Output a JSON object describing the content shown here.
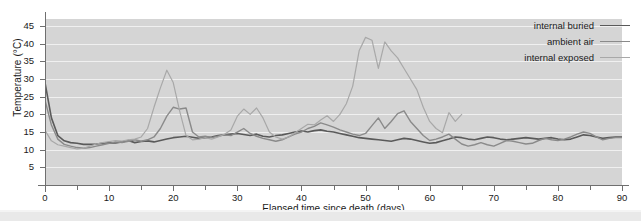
{
  "chart_data": {
    "type": "line",
    "title": "",
    "xlabel": "Elapsed time since death (days)",
    "ylabel": "Temperature (°C)",
    "xlim": [
      0,
      90
    ],
    "ylim": [
      0,
      47
    ],
    "xticks": [
      0,
      10,
      20,
      30,
      40,
      50,
      60,
      70,
      80,
      90
    ],
    "yticks": [
      5,
      10,
      15,
      20,
      25,
      30,
      35,
      40,
      45
    ],
    "xtick_minor_step": 5,
    "grid": "horizontal",
    "legend_position": "top-right",
    "plot_background": "#d5d5d5",
    "gridline_color": "#f0f0f0",
    "series": [
      {
        "name": "internal buried",
        "color": "#5a5a5a",
        "width": 1.6,
        "x": [
          0,
          1,
          2,
          3,
          4,
          5,
          6,
          7,
          8,
          9,
          10,
          11,
          12,
          13,
          14,
          15,
          16,
          17,
          18,
          19,
          20,
          21,
          22,
          23,
          24,
          25,
          26,
          27,
          28,
          29,
          30,
          31,
          32,
          33,
          34,
          35,
          36,
          37,
          38,
          39,
          40,
          41,
          42,
          43,
          44,
          45,
          46,
          47,
          48,
          49,
          50,
          51,
          52,
          53,
          54,
          55,
          56,
          57,
          58,
          59,
          60,
          61,
          62,
          63,
          64,
          65,
          66,
          67,
          68,
          69,
          70,
          71,
          72,
          73,
          74,
          75,
          76,
          77,
          78,
          79,
          80,
          81,
          82,
          83,
          84,
          85,
          86,
          87,
          88,
          89,
          90
        ],
        "y": [
          29.0,
          19.0,
          14.0,
          12.5,
          12.0,
          11.8,
          11.5,
          11.5,
          11.6,
          11.8,
          12.0,
          11.9,
          12.2,
          12.6,
          12.0,
          12.3,
          12.5,
          12.2,
          12.6,
          13.0,
          13.4,
          13.6,
          13.8,
          13.5,
          13.2,
          13.4,
          13.6,
          14.0,
          14.2,
          14.4,
          14.6,
          14.3,
          14.0,
          14.4,
          13.8,
          13.6,
          14.0,
          14.2,
          14.6,
          15.0,
          15.3,
          15.0,
          15.4,
          15.6,
          15.2,
          15.0,
          14.6,
          14.2,
          13.8,
          13.4,
          13.2,
          13.0,
          12.8,
          12.6,
          12.4,
          12.8,
          13.2,
          13.0,
          12.6,
          12.2,
          11.8,
          12.0,
          12.5,
          13.0,
          13.6,
          13.4,
          13.0,
          12.8,
          13.2,
          13.6,
          13.4,
          13.0,
          12.8,
          13.0,
          13.2,
          13.4,
          13.2,
          13.0,
          13.2,
          13.4,
          13.0,
          12.8,
          13.0,
          13.6,
          14.2,
          14.0,
          13.6,
          13.2,
          13.4,
          13.6,
          13.6
        ]
      },
      {
        "name": "ambient air",
        "color": "#8a8a8a",
        "width": 1.4,
        "x": [
          0,
          1,
          2,
          3,
          4,
          5,
          6,
          7,
          8,
          9,
          10,
          11,
          12,
          13,
          14,
          15,
          16,
          17,
          18,
          19,
          20,
          21,
          22,
          23,
          24,
          25,
          26,
          27,
          28,
          29,
          30,
          31,
          32,
          33,
          34,
          35,
          36,
          37,
          38,
          39,
          40,
          41,
          42,
          43,
          44,
          45,
          46,
          47,
          48,
          49,
          50,
          51,
          52,
          53,
          54,
          55,
          56,
          57,
          58,
          59,
          60,
          61,
          62,
          63,
          64,
          65,
          66,
          67,
          68,
          69,
          70,
          71,
          72,
          73,
          74,
          75,
          76,
          77,
          78,
          79,
          80,
          81,
          82,
          83,
          84,
          85,
          86,
          87,
          88,
          89,
          90
        ],
        "y": [
          24.0,
          17.0,
          13.0,
          11.5,
          11.0,
          10.6,
          10.4,
          10.6,
          11.0,
          11.4,
          11.8,
          12.2,
          12.0,
          12.4,
          12.8,
          12.4,
          12.8,
          13.6,
          16.0,
          19.5,
          22.0,
          21.5,
          21.8,
          15.0,
          13.6,
          13.8,
          13.4,
          13.8,
          14.2,
          14.0,
          15.0,
          16.0,
          14.6,
          13.8,
          13.2,
          12.8,
          12.4,
          12.8,
          13.6,
          14.4,
          15.0,
          16.0,
          16.6,
          17.6,
          17.0,
          16.4,
          15.6,
          15.0,
          14.4,
          14.0,
          14.6,
          16.8,
          19.0,
          16.0,
          18.0,
          20.2,
          21.0,
          18.0,
          16.0,
          14.0,
          12.6,
          13.0,
          13.6,
          14.4,
          13.0,
          11.6,
          11.0,
          11.4,
          12.0,
          11.4,
          11.0,
          11.8,
          12.6,
          12.4,
          12.0,
          11.6,
          11.8,
          12.6,
          13.2,
          12.8,
          12.6,
          13.0,
          13.6,
          14.4,
          15.0,
          14.6,
          13.6,
          12.8,
          13.2,
          13.4,
          13.4
        ]
      },
      {
        "name": "internal exposed",
        "color": "#a8a8a8",
        "width": 1.2,
        "x": [
          0,
          1,
          2,
          3,
          4,
          5,
          6,
          7,
          8,
          9,
          10,
          11,
          12,
          13,
          14,
          15,
          16,
          17,
          18,
          19,
          20,
          21,
          22,
          23,
          24,
          25,
          26,
          27,
          28,
          29,
          30,
          31,
          32,
          33,
          34,
          35,
          36,
          37,
          38,
          39,
          40,
          41,
          42,
          43,
          44,
          45,
          46,
          47,
          48,
          49,
          50,
          51,
          52,
          53,
          54,
          55,
          56,
          57,
          58,
          59,
          60,
          61,
          62,
          63,
          64,
          65
        ],
        "y": [
          15.5,
          12.5,
          11.4,
          11.0,
          10.6,
          10.2,
          10.4,
          11.0,
          11.6,
          12.0,
          12.3,
          12.6,
          12.4,
          12.8,
          13.0,
          13.6,
          16.0,
          22.0,
          27.5,
          32.5,
          29.0,
          21.0,
          14.0,
          12.8,
          13.0,
          13.4,
          13.0,
          13.6,
          14.4,
          15.6,
          19.5,
          21.5,
          20.0,
          21.8,
          19.0,
          15.0,
          13.6,
          13.0,
          13.6,
          14.8,
          16.0,
          17.2,
          17.0,
          18.4,
          19.6,
          18.0,
          20.0,
          23.0,
          28.0,
          38.0,
          41.8,
          41.0,
          33.0,
          40.5,
          38.0,
          36.0,
          33.0,
          30.0,
          27.0,
          22.0,
          18.0,
          16.0,
          14.8,
          20.5,
          18.0,
          20.0
        ]
      }
    ]
  },
  "legend": {
    "items": [
      {
        "label": "internal buried"
      },
      {
        "label": "ambient air"
      },
      {
        "label": "internal exposed"
      }
    ]
  }
}
